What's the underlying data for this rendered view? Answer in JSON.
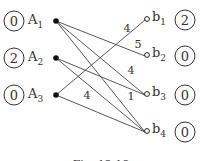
{
  "caption": "Fig. 12.18",
  "left_nodes": [
    {
      "id": "A1",
      "label": "A",
      "sub": "1",
      "value": "0",
      "x": 56,
      "y": 21
    },
    {
      "id": "A2",
      "label": "A",
      "sub": "2",
      "value": "2",
      "x": 56,
      "y": 58
    },
    {
      "id": "A3",
      "label": "A",
      "sub": "3",
      "value": "0",
      "x": 56,
      "y": 95
    }
  ],
  "right_nodes": [
    {
      "id": "b1",
      "label": "b",
      "sub": "1",
      "value": "2",
      "x": 147,
      "y": 19
    },
    {
      "id": "b2",
      "label": "b",
      "sub": "2",
      "value": "0",
      "x": 147,
      "y": 55
    },
    {
      "id": "b3",
      "label": "b",
      "sub": "3",
      "value": "0",
      "x": 147,
      "y": 94
    },
    {
      "id": "b4",
      "label": "b",
      "sub": "4",
      "value": "0",
      "x": 147,
      "y": 131
    }
  ],
  "edges": [
    {
      "from": "A1",
      "to": "b2",
      "weight": "5"
    },
    {
      "from": "A1",
      "to": "b3",
      "weight": "4"
    },
    {
      "from": "A1",
      "to": "b4",
      "weight": ""
    },
    {
      "from": "A2",
      "to": "b3",
      "weight": "1"
    },
    {
      "from": "A2",
      "to": "b4",
      "weight": ""
    },
    {
      "from": "A3",
      "to": "b1",
      "weight": "4"
    },
    {
      "from": "A3",
      "to": "b4",
      "weight": "4"
    }
  ],
  "weight_labels": [
    {
      "text": "4",
      "x": 127,
      "y": 32
    },
    {
      "text": "5",
      "x": 138,
      "y": 48
    },
    {
      "text": "4",
      "x": 131,
      "y": 74
    },
    {
      "text": "1",
      "x": 131,
      "y": 100
    },
    {
      "text": "4",
      "x": 87,
      "y": 99
    }
  ]
}
